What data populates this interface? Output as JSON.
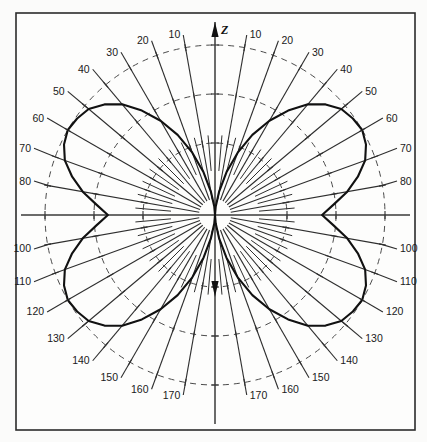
{
  "figure": {
    "title": "",
    "axis_label_z": "Z",
    "frame": {
      "x": 16,
      "y": 13,
      "width": 399,
      "height": 417
    },
    "center": {
      "x": 215,
      "y": 215
    },
    "outer_radius": 170,
    "colors": {
      "background": "#fbfbfa",
      "frame_stroke": "#2b2b2b",
      "grid_dashed": "#4a4a4a",
      "radial_line": "#2e2e2e",
      "pattern_curve": "#111111",
      "text": "#1a1a1a"
    }
  },
  "chart_data": {
    "type": "line",
    "plot_kind": "polar-radiation-pattern",
    "title": "",
    "subtitle": "",
    "xlabel": "",
    "ylabel": "",
    "axis_label": "Z",
    "angle_unit": "degrees",
    "angle_reference": "vertical axis Z (0 degrees at top)",
    "angle_ticks_labeled": [
      10,
      20,
      30,
      40,
      50,
      60,
      70,
      80,
      100,
      110,
      120,
      130,
      140,
      150,
      160,
      170
    ],
    "angle_tick_step": 10,
    "minor_angle_tick_step": 5,
    "labels_mirrored_left_and_right": true,
    "grid": {
      "radial_lines": true,
      "dashed_rings": true,
      "ring_radii_px": [
        72,
        121,
        170
      ],
      "ring_count": 3
    },
    "rlim": [
      0,
      1
    ],
    "legend": null,
    "legend_position": null,
    "annotations": [
      {
        "text": "Z",
        "angle_deg": 0,
        "note": "vertical axis arrow at top of plot"
      }
    ],
    "series": [
      {
        "name": "radiation pattern",
        "description": "four-lobe polar pattern with nulls along the vertical Z axis and maxima near 60 and 120 degrees on both sides",
        "nulls_deg": [
          0,
          180
        ],
        "maxima_deg": [
          60,
          120,
          240,
          300
        ],
        "theta_deg": [
          0,
          5,
          10,
          15,
          20,
          25,
          30,
          35,
          40,
          45,
          50,
          55,
          60,
          65,
          70,
          75,
          80,
          85,
          90,
          95,
          100,
          105,
          110,
          115,
          120,
          125,
          130,
          135,
          140,
          145,
          150,
          155,
          160,
          165,
          170,
          175,
          180
        ],
        "r_norm": [
          0.0,
          0.05,
          0.14,
          0.26,
          0.39,
          0.52,
          0.64,
          0.75,
          0.85,
          0.92,
          0.97,
          0.99,
          1.0,
          0.98,
          0.94,
          0.87,
          0.79,
          0.7,
          0.63,
          0.7,
          0.79,
          0.87,
          0.94,
          0.98,
          1.0,
          0.99,
          0.97,
          0.92,
          0.85,
          0.75,
          0.64,
          0.52,
          0.39,
          0.26,
          0.14,
          0.05,
          0.0
        ]
      }
    ]
  },
  "labels": {
    "left": [
      {
        "value": "10",
        "angle": 10
      },
      {
        "value": "20",
        "angle": 20
      },
      {
        "value": "30",
        "angle": 30
      },
      {
        "value": "40",
        "angle": 40
      },
      {
        "value": "50",
        "angle": 50
      },
      {
        "value": "60",
        "angle": 60
      },
      {
        "value": "70",
        "angle": 70
      },
      {
        "value": "80",
        "angle": 80
      },
      {
        "value": "100",
        "angle": 100
      },
      {
        "value": "110",
        "angle": 110
      },
      {
        "value": "120",
        "angle": 120
      },
      {
        "value": "130",
        "angle": 130
      },
      {
        "value": "140",
        "angle": 140
      },
      {
        "value": "150",
        "angle": 150
      },
      {
        "value": "160",
        "angle": 160
      },
      {
        "value": "170",
        "angle": 170
      }
    ],
    "right": [
      {
        "value": "10",
        "angle": 10
      },
      {
        "value": "20",
        "angle": 20
      },
      {
        "value": "30",
        "angle": 30
      },
      {
        "value": "40",
        "angle": 40
      },
      {
        "value": "50",
        "angle": 50
      },
      {
        "value": "60",
        "angle": 60
      },
      {
        "value": "70",
        "angle": 70
      },
      {
        "value": "80",
        "angle": 80
      },
      {
        "value": "100",
        "angle": 100
      },
      {
        "value": "110",
        "angle": 110
      },
      {
        "value": "120",
        "angle": 120
      },
      {
        "value": "130",
        "angle": 130
      },
      {
        "value": "140",
        "angle": 140
      },
      {
        "value": "150",
        "angle": 150
      },
      {
        "value": "160",
        "angle": 160
      },
      {
        "value": "170",
        "angle": 170
      }
    ]
  }
}
